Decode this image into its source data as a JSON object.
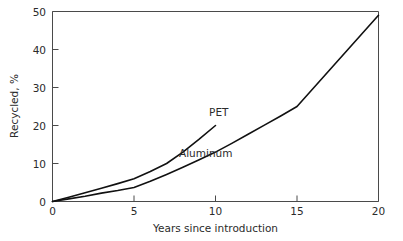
{
  "chart_data": {
    "type": "line",
    "title": "",
    "xlabel": "Years since introduction",
    "ylabel": "Recycled, %",
    "xlim": [
      0,
      20
    ],
    "ylim": [
      0,
      50
    ],
    "xticks": [
      0,
      5,
      10,
      15,
      20
    ],
    "yticks": [
      0,
      10,
      20,
      30,
      40,
      50
    ],
    "xtick_labels": [
      "0",
      "5",
      "10",
      "15",
      "20"
    ],
    "ytick_labels": [
      "0",
      "10",
      "20",
      "30",
      "40",
      "50"
    ],
    "grid": false,
    "legend_position": "inline-annotation",
    "line_color": "#111111",
    "series": [
      {
        "name": "PET",
        "label": "PET",
        "label_x": 10.2,
        "label_y": 22.6,
        "x": [
          0,
          1,
          2,
          3,
          4,
          5,
          6,
          7,
          8,
          9,
          10
        ],
        "values": [
          0,
          1.1,
          2.3,
          3.5,
          4.7,
          6.0,
          7.9,
          10.0,
          13.0,
          16.4,
          20.0
        ]
      },
      {
        "name": "Aluminum",
        "label": "Aluminum",
        "label_x": 9.4,
        "label_y": 11.6,
        "x": [
          0,
          1,
          2,
          3,
          4,
          5,
          6,
          7,
          8,
          9,
          10,
          11,
          12,
          13,
          14,
          15,
          16,
          17,
          18,
          19,
          20
        ],
        "values": [
          0,
          0.7,
          1.4,
          2.2,
          2.9,
          3.7,
          5.3,
          7.1,
          9.0,
          11.0,
          13.0,
          15.3,
          17.7,
          20.1,
          22.5,
          25.0,
          29.8,
          34.6,
          39.4,
          44.2,
          49.0
        ]
      }
    ]
  },
  "axes": {
    "y_axis_title": "Recycled, %",
    "x_axis_title": "Years since introduction"
  }
}
